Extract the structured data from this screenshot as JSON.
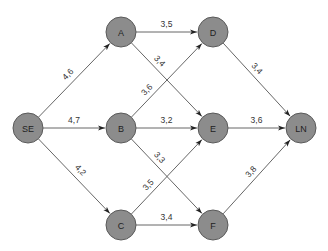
{
  "diagram": {
    "type": "directed-network",
    "colors": {
      "node_fill": "#8c8c8c",
      "node_stroke": "#5a5a5a",
      "edge": "#555555",
      "text": "#222222"
    },
    "nodes": [
      {
        "id": "SE",
        "label": "SE"
      },
      {
        "id": "A",
        "label": "A"
      },
      {
        "id": "B",
        "label": "B"
      },
      {
        "id": "C",
        "label": "C"
      },
      {
        "id": "D",
        "label": "D"
      },
      {
        "id": "E",
        "label": "E"
      },
      {
        "id": "F",
        "label": "F"
      },
      {
        "id": "LN",
        "label": "LN"
      }
    ],
    "edges": [
      {
        "from": "SE",
        "to": "A",
        "label": "4,6"
      },
      {
        "from": "SE",
        "to": "B",
        "label": "4,7"
      },
      {
        "from": "SE",
        "to": "C",
        "label": "4,2"
      },
      {
        "from": "A",
        "to": "D",
        "label": "3,5"
      },
      {
        "from": "A",
        "to": "E",
        "label": "3,4"
      },
      {
        "from": "B",
        "to": "D",
        "label": "3,6"
      },
      {
        "from": "B",
        "to": "E",
        "label": "3,2"
      },
      {
        "from": "B",
        "to": "F",
        "label": "3,3"
      },
      {
        "from": "C",
        "to": "E",
        "label": "3,5"
      },
      {
        "from": "C",
        "to": "F",
        "label": "3,4"
      },
      {
        "from": "D",
        "to": "LN",
        "label": "3,4"
      },
      {
        "from": "E",
        "to": "LN",
        "label": "3,6"
      },
      {
        "from": "F",
        "to": "LN",
        "label": "3,8"
      }
    ]
  }
}
